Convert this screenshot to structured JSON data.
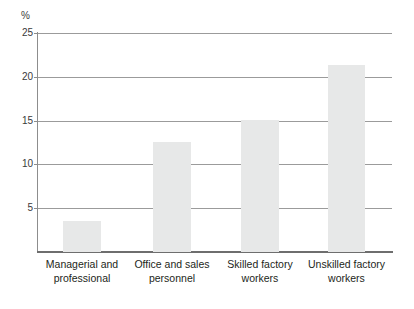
{
  "chart_data": {
    "type": "bar",
    "title": "",
    "subtitle": "",
    "xlabel": "",
    "ylabel": "%",
    "unit_label": "%",
    "categories": [
      "Managerial and professional",
      "Office and sales personnel",
      "Skilled factory workers",
      "Unskilled factory workers"
    ],
    "category_lines": [
      [
        "Managerial and",
        "professional"
      ],
      [
        "Office and sales",
        "personnel"
      ],
      [
        "Skilled factory",
        "workers"
      ],
      [
        "Unskilled factory",
        "workers"
      ]
    ],
    "values": [
      3.5,
      12.6,
      15.1,
      21.3
    ],
    "ylim": [
      0,
      25
    ],
    "yticks": [
      0,
      5,
      10,
      15,
      20,
      25
    ],
    "ytick_labels": [
      "0",
      "5",
      "10",
      "15",
      "20",
      "25"
    ],
    "grid": true,
    "grid_axis": "y",
    "legend": false,
    "legend_position": "none",
    "bar_color": "#e7e8e8",
    "grid_color": "#9b9b9b",
    "axis_color": "#6e6e6e",
    "text_color": "#231f20",
    "background_color": "#ffffff"
  }
}
